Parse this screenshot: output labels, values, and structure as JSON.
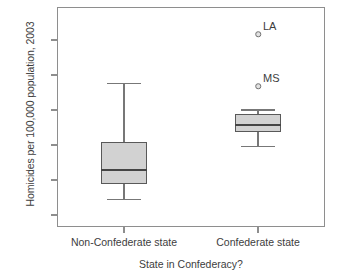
{
  "chart_data": {
    "type": "box",
    "title": "",
    "xlabel": "State in Confederacy?",
    "ylabel": "Homicides per 100,000 population, 2003",
    "categories": [
      "Non-Confederate state",
      "Confederate state"
    ],
    "ylim": [
      0.0,
      15.0
    ],
    "yticks": [
      0.0,
      2.5,
      5.0,
      7.5,
      10.0,
      12.5
    ],
    "ytick_labels": [
      "0.0",
      "2.5",
      "5.0",
      "7.5",
      "10.0",
      "12.5"
    ],
    "grid": false,
    "legend": "none",
    "boxes": [
      {
        "category": "Non-Confederate state",
        "whisker_low": 1.1,
        "q1": 2.2,
        "median": 3.2,
        "q3": 5.2,
        "whisker_high": 9.4,
        "outliers": []
      },
      {
        "category": "Confederate state",
        "whisker_low": 4.9,
        "q1": 5.9,
        "median": 6.4,
        "q3": 7.2,
        "whisker_high": 7.5,
        "outliers": [
          {
            "label": "LA",
            "value": 12.9
          },
          {
            "label": "MS",
            "value": 9.2
          }
        ]
      }
    ],
    "colors": {
      "box_fill": "#d2d2d2",
      "box_edge": "#595959",
      "median": "#454545",
      "whisker": "#777777",
      "frame": "#8e8e8e",
      "text": "#3d3d3d",
      "background": "#ffffff"
    }
  }
}
